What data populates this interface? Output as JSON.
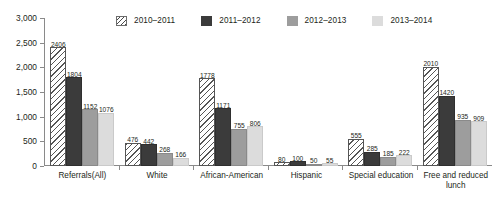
{
  "chart_data": {
    "type": "bar",
    "title": "",
    "subtitle": "",
    "xlabel": "",
    "ylabel": "",
    "ylim": [
      0,
      3000
    ],
    "ytick_labels": [
      "0",
      "500",
      "1,000",
      "1,500",
      "2,000",
      "2,500",
      "3,000"
    ],
    "ytick_values": [
      0,
      500,
      1000,
      1500,
      2000,
      2500,
      3000
    ],
    "grid": false,
    "legend_position": "top-center",
    "categories": [
      "Referrals(All)",
      "White",
      "African-American",
      "Hispanic",
      "Special education",
      "Free and reduced lunch"
    ],
    "series": [
      {
        "name": "2010–2011",
        "color": "#ffffff",
        "pattern": "diagonal-hatch",
        "values": [
          2406,
          476,
          1778,
          80,
          555,
          2010
        ]
      },
      {
        "name": "2011–2012",
        "color": "#3b3b3b",
        "pattern": "solid",
        "values": [
          1804,
          442,
          1171,
          100,
          285,
          1420
        ]
      },
      {
        "name": "2012–2013",
        "color": "#9d9d9d",
        "pattern": "solid",
        "values": [
          1152,
          268,
          755,
          50,
          185,
          935
        ]
      },
      {
        "name": "2013–2014",
        "color": "#dcdcdc",
        "pattern": "solid",
        "values": [
          1076,
          166,
          806,
          55,
          222,
          909
        ]
      }
    ]
  }
}
